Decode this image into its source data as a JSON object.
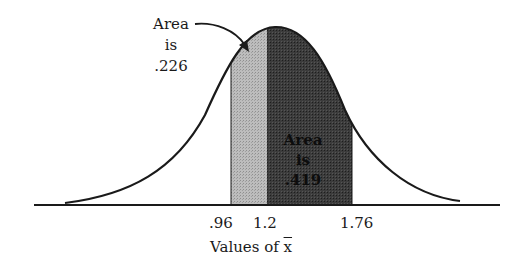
{
  "diagram": {
    "type": "normal-distribution-shaded-areas",
    "colors": {
      "curve": "#1a1a1a",
      "light_region": "#b3b3b3",
      "dark_region": "#3a3a3a",
      "background": "#ffffff"
    },
    "annotations": {
      "left": {
        "line1": "Area",
        "line2": "is",
        "line3": ".226"
      },
      "inner": {
        "line1": "Area",
        "line2": "is",
        "line3": ".419"
      }
    },
    "ticks": [
      ".96",
      "1.2",
      "1.76"
    ],
    "x_axis_label_prefix": "Values of ",
    "x_axis_label_var": "x"
  }
}
